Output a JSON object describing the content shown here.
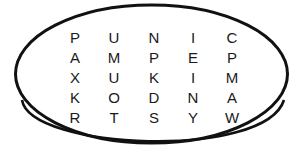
{
  "puzzle": {
    "type": "letter-grid-on-plate",
    "rows": [
      [
        "P",
        "U",
        "N",
        "I",
        "C"
      ],
      [
        "A",
        "M",
        "P",
        "E",
        "P"
      ],
      [
        "X",
        "U",
        "K",
        "I",
        "M"
      ],
      [
        "K",
        "O",
        "D",
        "N",
        "A"
      ],
      [
        "R",
        "T",
        "S",
        "Y",
        "W"
      ]
    ],
    "colors": {
      "outline": "#111111",
      "text": "#1a1a1a",
      "background": "#ffffff"
    }
  }
}
